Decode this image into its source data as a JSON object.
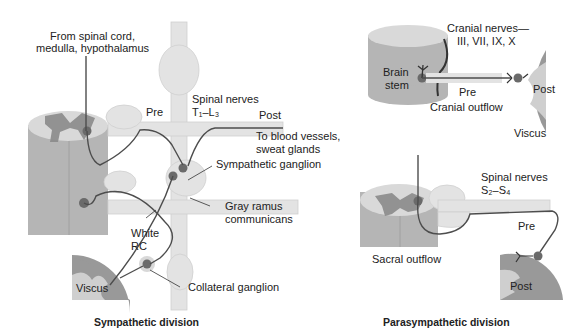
{
  "sympathetic": {
    "title": "Sympathetic division",
    "labels": {
      "from_spinal_cord_1": "From spinal cord,",
      "from_spinal_cord_2": "medulla, hypothalamus",
      "pre": "Pre",
      "spinal_nerves": "Spinal nerves",
      "spinal_range": "T₁–L₃",
      "post": "Post",
      "to_blood_1": "To blood vessels,",
      "to_blood_2": "sweat glands",
      "sympathetic_ganglion": "Sympathetic ganglion",
      "gray_ramus_1": "Gray ramus",
      "gray_ramus_2": "communicans",
      "white_1": "White",
      "white_2": "RC",
      "viscus": "Viscus",
      "collateral_ganglion": "Collateral ganglion"
    }
  },
  "parasympathetic": {
    "title": "Parasympathetic division",
    "labels": {
      "cranial_nerves_1": "Cranial nerves—",
      "cranial_nerves_2": "III, VII, IX, X",
      "brain_1": "Brain",
      "brain_2": "stem",
      "pre_cranial": "Pre",
      "cranial_outflow": "Cranial outflow",
      "post_cranial": "Post",
      "viscus": "Viscus",
      "spinal_nerves": "Spinal nerves",
      "spinal_range": "S₂–S₄",
      "pre_sacral": "Pre",
      "sacral_outflow": "Sacral outflow",
      "post_sacral": "Post"
    }
  },
  "colors": {
    "light": "#e6e6e6",
    "mid": "#c4c4c4",
    "dark": "#8e8e8e",
    "nerve": "#555555"
  }
}
